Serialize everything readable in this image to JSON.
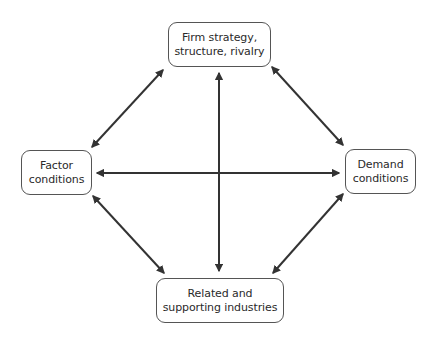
{
  "diagram": {
    "title": "",
    "type": "diamond",
    "colors": {
      "line": "#333333",
      "box_border": "#555555",
      "text": "#2a2a2a",
      "background": "#ffffff"
    },
    "nodes": [
      {
        "id": "top",
        "lines": [
          "Firm strategy,",
          "structure, rivalry"
        ]
      },
      {
        "id": "left",
        "lines": [
          "Factor",
          "conditions"
        ]
      },
      {
        "id": "right",
        "lines": [
          "Demand",
          "conditions"
        ]
      },
      {
        "id": "bottom",
        "lines": [
          "Related and",
          "supporting industries"
        ]
      }
    ],
    "edges": [
      {
        "from": "top",
        "to": "left",
        "style": "double-arrow"
      },
      {
        "from": "top",
        "to": "right",
        "style": "double-arrow"
      },
      {
        "from": "left",
        "to": "bottom",
        "style": "double-arrow"
      },
      {
        "from": "right",
        "to": "bottom",
        "style": "double-arrow"
      },
      {
        "from": "top",
        "to": "bottom",
        "style": "double-arrow"
      },
      {
        "from": "left",
        "to": "right",
        "style": "double-arrow"
      }
    ]
  }
}
